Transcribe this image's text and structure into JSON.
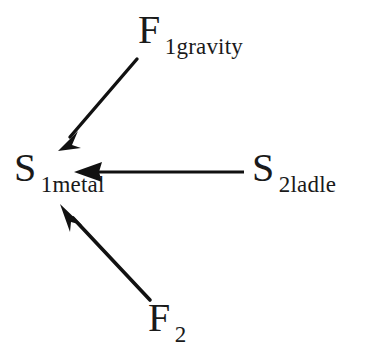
{
  "diagram": {
    "type": "force-interaction-diagram",
    "background_color": "#ffffff",
    "stroke_color": "#111111",
    "nodes": [
      {
        "id": "f1gravity",
        "base": "F",
        "subscript": "1gravity",
        "role": "gravity-force-label",
        "x": 138,
        "y": 10
      },
      {
        "id": "s1metal",
        "base": "S",
        "subscript": "1metal",
        "role": "central-system-label",
        "x": 14,
        "y": 148
      },
      {
        "id": "s2ladle",
        "base": "S",
        "subscript": "2ladle",
        "role": "ladle-system-label",
        "x": 252,
        "y": 148
      },
      {
        "id": "f2",
        "base": "F",
        "subscript": "2",
        "role": "second-force-label",
        "x": 148,
        "y": 298
      }
    ],
    "arrows": [
      {
        "id": "arrow-gravity",
        "from": "f1gravity",
        "to": "s1metal",
        "tail_x": 138,
        "tail_y": 58,
        "tip_x": 58,
        "tip_y": 151,
        "direction": "down-left"
      },
      {
        "id": "arrow-ladle",
        "from": "s2ladle",
        "to": "s1metal",
        "tail_x": 244,
        "tail_y": 172,
        "tip_x": 74,
        "tip_y": 172,
        "direction": "left"
      },
      {
        "id": "arrow-f2",
        "from": "f2",
        "to": "s1metal",
        "tail_x": 150,
        "tail_y": 300,
        "tip_x": 60,
        "tip_y": 204,
        "direction": "up-left"
      }
    ]
  }
}
